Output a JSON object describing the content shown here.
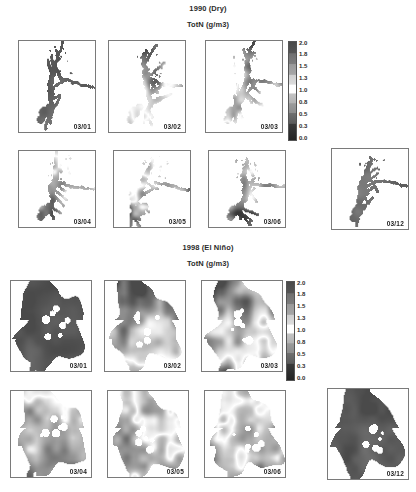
{
  "figure": {
    "background": "#ffffff",
    "sections": [
      {
        "id": "sec-1990",
        "title": "1990 (Dry)",
        "subtitle": "TotN  (g/m3)",
        "panels": [
          {
            "label": "03/01",
            "row": 0,
            "col": 0,
            "style": "dry-dark"
          },
          {
            "label": "03/02",
            "row": 0,
            "col": 1,
            "style": "dry-mixed"
          },
          {
            "label": "03/03",
            "row": 0,
            "col": 2,
            "style": "dry-mixed2"
          },
          {
            "label": "03/04",
            "row": 1,
            "col": 0,
            "style": "dry-light"
          },
          {
            "label": "03/05",
            "row": 1,
            "col": 1,
            "style": "dry-light2"
          },
          {
            "label": "03/06",
            "row": 1,
            "col": 2,
            "style": "dry-light3"
          },
          {
            "label": "03/12",
            "row": 1,
            "col": 3,
            "style": "dry-dark2"
          }
        ],
        "colorbar": {
          "ticks": [
            "2.0",
            "1.8",
            "1.5",
            "1.3",
            "1.0",
            "0.8",
            "0.5",
            "0.3",
            "0.0"
          ],
          "min": 0.0,
          "max": 2.0
        }
      },
      {
        "id": "sec-1998",
        "title": "1998 (El Niño)",
        "subtitle": "TotN  (g/m3)",
        "panels": [
          {
            "label": "03/01",
            "row": 0,
            "col": 0,
            "style": "nino-dark"
          },
          {
            "label": "03/02",
            "row": 0,
            "col": 1,
            "style": "nino-mixed"
          },
          {
            "label": "03/03",
            "row": 0,
            "col": 2,
            "style": "nino-mixed2"
          },
          {
            "label": "03/04",
            "row": 1,
            "col": 0,
            "style": "nino-light"
          },
          {
            "label": "03/05",
            "row": 1,
            "col": 1,
            "style": "nino-light2"
          },
          {
            "label": "03/06",
            "row": 1,
            "col": 2,
            "style": "nino-light3"
          },
          {
            "label": "03/12",
            "row": 1,
            "col": 3,
            "style": "nino-dark2"
          }
        ],
        "colorbar": {
          "ticks": [
            "2.0",
            "1.8",
            "1.5",
            "1.3",
            "1.0",
            "0.8",
            "0.5",
            "0.3",
            "0.0"
          ],
          "min": 0.0,
          "max": 2.0
        }
      }
    ]
  },
  "chart_data": {
    "type": "heatmap",
    "variable": "TotN",
    "units": "g/m3",
    "colormap": "grayscale-banded",
    "colorbar_ticks": [
      2.0,
      1.8,
      1.5,
      1.3,
      1.0,
      0.8,
      0.5,
      0.3,
      0.0
    ],
    "zlim": [
      0.0,
      2.0
    ],
    "grid": false,
    "legend": "colorbar-right",
    "panel_dates": [
      "03/01",
      "03/02",
      "03/03",
      "03/04",
      "03/05",
      "03/06",
      "03/12"
    ],
    "series": [
      {
        "name": "1990 (Dry)",
        "panels": [
          {
            "date": "03/01",
            "mean_totn": 1.85,
            "range": [
              1.3,
              2.0
            ],
            "extent": "narrow-dendritic"
          },
          {
            "date": "03/02",
            "mean_totn": 1.45,
            "range": [
              0.5,
              2.0
            ],
            "extent": "patchy"
          },
          {
            "date": "03/03",
            "mean_totn": 1.4,
            "range": [
              0.5,
              2.0
            ],
            "extent": "patchy"
          },
          {
            "date": "03/04",
            "mean_totn": 0.9,
            "range": [
              0.3,
              1.5
            ],
            "extent": "narrow-dendritic"
          },
          {
            "date": "03/05",
            "mean_totn": 1.0,
            "range": [
              0.3,
              1.8
            ],
            "extent": "narrow-dendritic"
          },
          {
            "date": "03/06",
            "mean_totn": 0.8,
            "range": [
              0.3,
              1.3
            ],
            "extent": "narrow-dendritic"
          },
          {
            "date": "03/12",
            "mean_totn": 1.8,
            "range": [
              1.3,
              2.0
            ],
            "extent": "narrow-dendritic"
          }
        ]
      },
      {
        "name": "1998 (El Niño)",
        "panels": [
          {
            "date": "03/01",
            "mean_totn": 1.95,
            "range": [
              1.8,
              2.0
            ],
            "extent": "broad-flooded"
          },
          {
            "date": "03/02",
            "mean_totn": 1.55,
            "range": [
              0.8,
              2.0
            ],
            "extent": "broad-flooded"
          },
          {
            "date": "03/03",
            "mean_totn": 1.4,
            "range": [
              0.5,
              2.0
            ],
            "extent": "broad-flooded"
          },
          {
            "date": "03/04",
            "mean_totn": 0.85,
            "range": [
              0.3,
              1.5
            ],
            "extent": "broad-flooded"
          },
          {
            "date": "03/05",
            "mean_totn": 1.05,
            "range": [
              0.3,
              1.8
            ],
            "extent": "broad-flooded"
          },
          {
            "date": "03/06",
            "mean_totn": 1.0,
            "range": [
              0.3,
              1.8
            ],
            "extent": "broad-flooded"
          },
          {
            "date": "03/12",
            "mean_totn": 1.9,
            "range": [
              1.5,
              2.0
            ],
            "extent": "broad-flooded"
          }
        ]
      }
    ]
  }
}
